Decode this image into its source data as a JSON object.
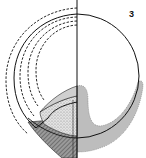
{
  "figure": {
    "panel_label": "3",
    "colors": {
      "line": "#111111",
      "gray_layer": "#bdbdbd",
      "light_stipple": "#d9d9d9",
      "dark_hatch": "#8a8a8a",
      "background": "#ffffff"
    },
    "elements": [
      "midline",
      "outer-solid-circle",
      "dashed-arcs",
      "inner-solid-arc",
      "gray-crescent-layer",
      "stippled-wedge",
      "hatched-band"
    ]
  }
}
